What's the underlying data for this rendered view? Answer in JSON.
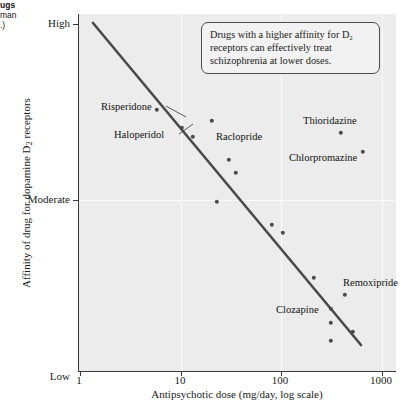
{
  "figure": {
    "caption_fragments": [
      {
        "text": "ugs",
        "bold": true,
        "x": 0,
        "y": 1
      },
      {
        "text": "man",
        "bold": false,
        "x": 0,
        "y": 11
      },
      {
        "text": ".)",
        "bold": false,
        "x": 0,
        "y": 21
      }
    ],
    "callout": "Drugs with a higher affinity for D₂ receptors can effectively treat schizophrenia at lower doses."
  },
  "chart_data": {
    "type": "scatter",
    "title": "",
    "xlabel": "Antipsychotic dose (mg/day, log scale)",
    "ylabel": "Affinity of drug for dopamine D₂ receptors",
    "xscale": "log",
    "xlim": [
      1,
      2000
    ],
    "xticks": [
      1,
      10,
      100,
      1000
    ],
    "xtick_labels": [
      "1",
      "10",
      "100",
      "1000"
    ],
    "ytick_labels": [
      "High",
      "Moderate",
      "Low"
    ],
    "ylabel_qualitative": true,
    "grid": "vertical white gridlines at decades, horizontal gridline at Moderate",
    "legend": "none",
    "marker_color": "#4a4a4a",
    "trendline": {
      "present": true,
      "color": "#4a4a4a",
      "direction": "negative",
      "description": "Straight negative-slope fit: higher affinity corresponds to lower effective dose",
      "x_start_px": 92,
      "y_start_px": 23,
      "x_end_px": 360,
      "y_end_px": 345
    },
    "points": [
      {
        "label": "",
        "x_px": 156,
        "y_px": 110
      },
      {
        "label": "Risperidone",
        "x_px": 211,
        "y_px": 121
      },
      {
        "label": "Haloperidol",
        "x_px": 181,
        "y_px": 128
      },
      {
        "label": "",
        "x_px": 192,
        "y_px": 137
      },
      {
        "label": "Raclopride",
        "x_px": 228,
        "y_px": 160
      },
      {
        "label": "Thioridazine",
        "x_px": 340,
        "y_px": 133
      },
      {
        "label": "Chlorpromazine",
        "x_px": 362,
        "y_px": 152
      },
      {
        "label": "",
        "x_px": 235,
        "y_px": 173
      },
      {
        "label": "",
        "x_px": 216,
        "y_px": 202
      },
      {
        "label": "",
        "x_px": 271,
        "y_px": 225
      },
      {
        "label": "",
        "x_px": 282,
        "y_px": 233
      },
      {
        "label": "",
        "x_px": 313,
        "y_px": 278
      },
      {
        "label": "Remoxipride",
        "x_px": 344,
        "y_px": 295
      },
      {
        "label": "Clozapine",
        "x_px": 330,
        "y_px": 309
      },
      {
        "label": "",
        "x_px": 330,
        "y_px": 323
      },
      {
        "label": "",
        "x_px": 330,
        "y_px": 341
      },
      {
        "label": "",
        "x_px": 352,
        "y_px": 332
      }
    ],
    "drug_labels": [
      {
        "name": "Risperidone",
        "text_x": 100,
        "text_y": 101,
        "leader": [
          165,
          106,
          185,
          117
        ]
      },
      {
        "name": "Haloperidol",
        "text_x": 113,
        "text_y": 129,
        "leader": [
          178,
          134,
          192,
          124
        ]
      },
      {
        "name": "Raclopride",
        "text_x": 215,
        "text_y": 131,
        "leader": null
      },
      {
        "name": "Thioridazine",
        "text_x": 302,
        "text_y": 115,
        "leader": null
      },
      {
        "name": "Chlorpromazine",
        "text_x": 288,
        "text_y": 152,
        "leader": null
      },
      {
        "name": "Clozapine",
        "text_x": 275,
        "text_y": 304,
        "leader": null
      },
      {
        "name": "Remoxipride",
        "text_x": 342,
        "text_y": 277,
        "leader": null
      }
    ]
  },
  "axes": {
    "y_ticks": [
      {
        "label": "High",
        "y_px": 24
      },
      {
        "label": "Moderate",
        "y_px": 200
      },
      {
        "label": "Low",
        "y_px": 377
      }
    ],
    "x_ticks": [
      {
        "label": "1",
        "x_px": 79
      },
      {
        "label": "10",
        "x_px": 180
      },
      {
        "label": "100",
        "x_px": 280
      },
      {
        "label": "1000",
        "x_px": 381
      }
    ]
  }
}
